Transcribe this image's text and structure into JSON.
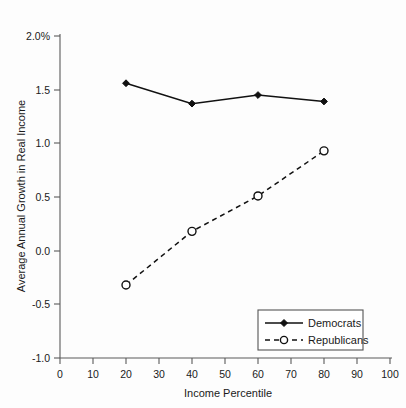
{
  "chart_data": {
    "type": "line",
    "title": "",
    "xlabel": "Income Percentile",
    "ylabel": "Average Annual Growth in Real Income",
    "x": [
      20,
      40,
      60,
      80
    ],
    "xlim": [
      0,
      100
    ],
    "ylim": [
      -1.0,
      2.0
    ],
    "xticks": [
      "0",
      "10",
      "20",
      "30",
      "40",
      "50",
      "60",
      "70",
      "80",
      "90",
      "100"
    ],
    "xtick_values": [
      0,
      10,
      20,
      30,
      40,
      50,
      60,
      70,
      80,
      90,
      100
    ],
    "yticks": [
      "2.0%",
      "1.5",
      "1.0",
      "0.5",
      "0.0",
      "-0.5",
      "-1.0"
    ],
    "ytick_values": [
      2.0,
      1.5,
      1.0,
      0.5,
      0.0,
      -0.5,
      -1.0
    ],
    "grid": false,
    "legend_position": "bottom-right",
    "series": [
      {
        "name": "Democrats",
        "values": [
          1.56,
          1.37,
          1.45,
          1.39
        ],
        "line_style": "solid",
        "marker": "filled-diamond",
        "color": "#111111"
      },
      {
        "name": "Republicans",
        "values": [
          -0.32,
          0.18,
          0.51,
          0.93
        ],
        "line_style": "dashed",
        "marker": "open-circle",
        "color": "#111111"
      }
    ]
  },
  "legend": {
    "items": [
      {
        "label": "Democrats"
      },
      {
        "label": "Republicans"
      }
    ]
  },
  "axes": {
    "x_title": "Income Percentile",
    "y_title": "Average Annual Growth in Real Income"
  },
  "colors": {
    "background": "#fdfdfd",
    "axis": "#5a5a5a",
    "series": "#111111",
    "text": "#1a1a1a"
  }
}
